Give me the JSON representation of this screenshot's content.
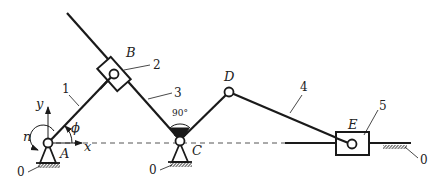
{
  "diagram": {
    "type": "planar-linkage-mechanism",
    "joints": {
      "A": {
        "label": "A",
        "x": 48,
        "y": 143
      },
      "B": {
        "label": "B",
        "x": 114,
        "y": 74
      },
      "C": {
        "label": "C",
        "x": 180,
        "y": 143
      },
      "D": {
        "label": "D",
        "x": 229,
        "y": 92
      },
      "E": {
        "label": "E",
        "x": 351,
        "y": 144
      }
    },
    "links": [
      {
        "id": "1",
        "label": "1",
        "from": "A",
        "to": "B"
      },
      {
        "id": "2",
        "label": "2",
        "type": "slider-block",
        "at": "B"
      },
      {
        "id": "3",
        "label": "3",
        "type": "guide-bar",
        "through": [
          "B",
          "C"
        ]
      },
      {
        "id": "4",
        "label": "4",
        "from": "D",
        "to": "E"
      },
      {
        "id": "5",
        "label": "5",
        "type": "slider-block",
        "at": "E"
      }
    ],
    "ground_label": "0",
    "axes": {
      "x_label": "x",
      "y_label": "y"
    },
    "angle_label": "ϕ",
    "speed_label": "n",
    "right_angle_label": "90°",
    "colors": {
      "ink": "#1a1a1a",
      "background": "#ffffff"
    }
  }
}
